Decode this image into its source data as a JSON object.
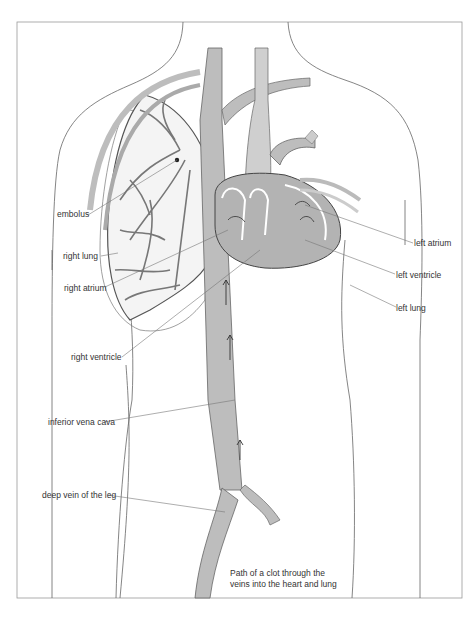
{
  "diagram": {
    "caption_line1": "Path of a clot through the",
    "caption_line2": "veins into the heart and lung",
    "labels": {
      "embolus": "embolus",
      "right_lung": "right lung",
      "right_atrium": "right atrium",
      "right_ventricle": "right ventricle",
      "inferior_vena_cava": "inferior vena cava",
      "deep_vein": "deep vein of the leg",
      "left_atrium": "left atrium",
      "left_ventricle": "left ventricle",
      "left_lung": "left lung"
    },
    "colors": {
      "vessel_fill": "#bdbdbd",
      "vessel_stroke": "#555555",
      "outline": "#666666",
      "leader_line": "#777777",
      "heart_fill": "#b3b3b3",
      "frame": "#999999"
    }
  }
}
